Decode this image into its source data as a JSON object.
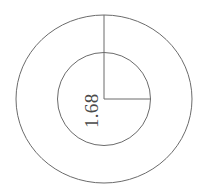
{
  "drawing": {
    "title": "concentric-circles-radius-dimension",
    "background_color": "#ffffff",
    "stroke_color": "#6b6b6b",
    "text_color": "#4a4a4a",
    "stroke_width": 1,
    "center": {
      "x": 104,
      "y": 99
    },
    "outer_circle": {
      "name": "outer-circle",
      "rx": 88,
      "ry": 84
    },
    "inner_circle": {
      "name": "inner-circle",
      "rx": 46.5,
      "ry": 46.5
    },
    "vertical_leader": {
      "name": "vertical-radius-line",
      "x1": 104,
      "y1": 99,
      "x2": 104,
      "y2": 15
    },
    "horizontal_leader": {
      "name": "horizontal-radius-line",
      "x1": 104,
      "y1": 99,
      "x2": 150.5,
      "y2": 99
    },
    "dimension_label": {
      "value": "1.68",
      "rotation_deg": -90,
      "x": 98,
      "y": 128
    }
  }
}
